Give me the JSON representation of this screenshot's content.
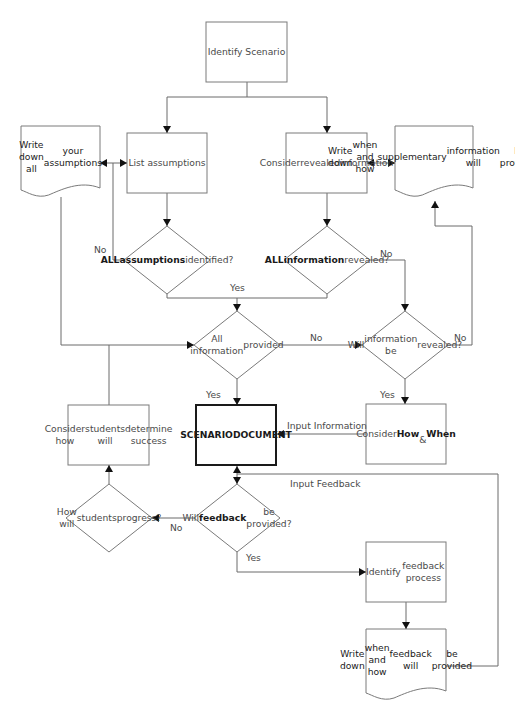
{
  "diagram": {
    "type": "flowchart",
    "nodes": [
      {
        "id": "identify-scenario",
        "shape": "rect",
        "x": 206,
        "y": 22,
        "w": 81,
        "h": 60,
        "lines": [
          "Identify Scenario"
        ]
      },
      {
        "id": "list-assumptions",
        "shape": "rect",
        "x": 127,
        "y": 133,
        "w": 80,
        "h": 60,
        "lines": [
          "List assumptions"
        ]
      },
      {
        "id": "consider-revealed-information",
        "shape": "rect",
        "x": 286,
        "y": 133,
        "w": 81,
        "h": 60,
        "lines": [
          "Consider",
          "revealed",
          "information"
        ]
      },
      {
        "id": "write-down-assumptions",
        "shape": "document",
        "x": 21,
        "y": 126,
        "w": 79,
        "h": 72,
        "lines": [
          "Write down all",
          "your assumptions"
        ]
      },
      {
        "id": "write-down-supplementary",
        "shape": "document",
        "x": 395,
        "y": 126,
        "w": 78,
        "h": 72,
        "lines": [
          "Write down",
          "when and how",
          "supplementary",
          "information will",
          "be provided"
        ]
      },
      {
        "id": "all-assumptions-identified",
        "shape": "diamond",
        "cx": 167,
        "cy": 260,
        "rx": 43,
        "ry": 34,
        "lines": [
          "ALL",
          "assumptions",
          "identified?"
        ],
        "bold_lines": [
          0,
          1
        ]
      },
      {
        "id": "all-information-revealed",
        "shape": "diamond",
        "cx": 327,
        "cy": 260,
        "rx": 43,
        "ry": 34,
        "lines": [
          "ALL",
          "information",
          "revealed?"
        ],
        "bold_lines": [
          0,
          1
        ]
      },
      {
        "id": "all-information-provided",
        "shape": "diamond",
        "cx": 237,
        "cy": 345,
        "rx": 43,
        "ry": 34,
        "lines": [
          "All information",
          "provided"
        ]
      },
      {
        "id": "will-information-be-revealed",
        "shape": "diamond",
        "cx": 405,
        "cy": 345,
        "rx": 43,
        "ry": 34,
        "lines": [
          "Will",
          "information be",
          "revealed?"
        ]
      },
      {
        "id": "scenario-document",
        "shape": "rect-thick",
        "x": 196,
        "y": 405,
        "w": 80,
        "h": 60,
        "lines": [
          "SCENARIO",
          "DOCUMENT"
        ],
        "bold_lines": [
          0,
          1
        ]
      },
      {
        "id": "consider-how-students-determine-success",
        "shape": "rect",
        "x": 68,
        "y": 405,
        "w": 81,
        "h": 60,
        "lines": [
          "Consider how",
          "students will",
          "determine success"
        ]
      },
      {
        "id": "consider-how-when",
        "shape": "rect",
        "x": 366,
        "y": 404,
        "w": 80,
        "h": 60,
        "rich": "Consider <b>How</b><br>&amp; <b>When</b>",
        "lines": [
          "Consider How",
          "& When"
        ]
      },
      {
        "id": "how-will-students-progress",
        "shape": "diamond",
        "cx": 109,
        "cy": 518,
        "rx": 43,
        "ry": 34,
        "lines": [
          "How will",
          "students",
          "progress?"
        ]
      },
      {
        "id": "will-feedback-be-provided",
        "shape": "diamond",
        "cx": 237,
        "cy": 518,
        "rx": 43,
        "ry": 34,
        "rich": "Will<br><b>feedback</b> be<br>provided?",
        "lines": [
          "Will",
          "feedback be",
          "provided?"
        ]
      },
      {
        "id": "identify-feedback-process",
        "shape": "rect",
        "x": 366,
        "y": 542,
        "w": 80,
        "h": 60,
        "lines": [
          "Identify",
          "feedback process"
        ]
      },
      {
        "id": "write-down-feedback",
        "shape": "document",
        "x": 366,
        "y": 629,
        "w": 80,
        "h": 72,
        "lines": [
          "Write down",
          "when and how",
          "feedback will",
          "be provided"
        ]
      }
    ],
    "edges": [
      {
        "from": "identify-scenario",
        "to": "list-assumptions",
        "points": [
          [
            247,
            82
          ],
          [
            247,
            97
          ],
          [
            167,
            97
          ],
          [
            167,
            133
          ]
        ],
        "arrow_end": true
      },
      {
        "from": "identify-scenario",
        "to": "consider-revealed-information",
        "points": [
          [
            247,
            97
          ],
          [
            327,
            97
          ],
          [
            327,
            133
          ]
        ],
        "arrow_end": true
      },
      {
        "from": "list-assumptions",
        "to": "write-down-assumptions",
        "points": [
          [
            127,
            163
          ],
          [
            100,
            163
          ]
        ],
        "arrow_end": true,
        "arrow_start": true
      },
      {
        "from": "consider-revealed-information",
        "to": "write-down-supplementary",
        "points": [
          [
            367,
            163
          ],
          [
            395,
            163
          ]
        ],
        "arrow_end": true,
        "arrow_start": true
      },
      {
        "from": "list-assumptions",
        "to": "all-assumptions-identified",
        "points": [
          [
            167,
            193
          ],
          [
            167,
            226
          ]
        ],
        "arrow_end": true
      },
      {
        "from": "consider-revealed-information",
        "to": "all-information-revealed",
        "points": [
          [
            327,
            193
          ],
          [
            327,
            226
          ]
        ],
        "arrow_end": true
      },
      {
        "from": "all-assumptions-identified",
        "to": "list-assumptions",
        "label": "No",
        "points": [
          [
            124,
            260
          ],
          [
            113,
            260
          ],
          [
            113,
            163
          ]
        ]
      },
      {
        "from": "all-assumptions-identified",
        "to": "all-information-provided",
        "label": "Yes",
        "points": [
          [
            167,
            294
          ],
          [
            167,
            298
          ],
          [
            327,
            298
          ],
          [
            327,
            294
          ]
        ]
      },
      {
        "from": "join-yes",
        "to": "all-information-provided",
        "points": [
          [
            237,
            298
          ],
          [
            237,
            311
          ]
        ],
        "arrow_end": true
      },
      {
        "from": "all-information-revealed",
        "to": "will-information-be-revealed",
        "label": "No",
        "points": [
          [
            370,
            260
          ],
          [
            405,
            260
          ],
          [
            405,
            311
          ]
        ],
        "arrow_end": true
      },
      {
        "from": "write-down-assumptions",
        "to": "all-information-provided",
        "points": [
          [
            61,
            197
          ],
          [
            61,
            345
          ],
          [
            194,
            345
          ]
        ],
        "arrow_end": true
      },
      {
        "from": "consider-how-students-determine-success",
        "to": "all-information-provided",
        "points": [
          [
            109,
            405
          ],
          [
            109,
            345
          ]
        ]
      },
      {
        "from": "all-information-provided",
        "to": "will-information-be-revealed",
        "label": "No",
        "points": [
          [
            280,
            345
          ],
          [
            362,
            345
          ]
        ],
        "arrow_end": true
      },
      {
        "from": "will-information-be-revealed",
        "to": "write-down-supplementary",
        "label": "No",
        "points": [
          [
            448,
            345
          ],
          [
            472,
            345
          ],
          [
            472,
            226
          ],
          [
            435,
            226
          ],
          [
            435,
            201
          ]
        ],
        "arrow_end": true
      },
      {
        "from": "all-information-provided",
        "to": "scenario-document",
        "label": "Yes",
        "points": [
          [
            237,
            379
          ],
          [
            237,
            405
          ]
        ],
        "arrow_end": true
      },
      {
        "from": "will-information-be-revealed",
        "to": "consider-how-when",
        "label": "Yes",
        "points": [
          [
            405,
            379
          ],
          [
            405,
            404
          ]
        ],
        "arrow_end": true
      },
      {
        "from": "consider-how-when",
        "to": "scenario-document",
        "label": "Input Information",
        "points": [
          [
            366,
            434
          ],
          [
            277,
            434
          ]
        ],
        "arrow_end": true
      },
      {
        "from": "scenario-document",
        "to": "will-feedback-be-provided",
        "points": [
          [
            237,
            466
          ],
          [
            237,
            484
          ]
        ],
        "arrow_end": true,
        "arrow_start": true
      },
      {
        "from": "write-down-feedback",
        "to": "scenario-document",
        "label": "Input Feedback",
        "points": [
          [
            446,
            666
          ],
          [
            498,
            666
          ],
          [
            498,
            474
          ],
          [
            237,
            474
          ]
        ]
      },
      {
        "from": "will-feedback-be-provided",
        "to": "how-will-students-progress",
        "label": "No",
        "points": [
          [
            194,
            518
          ],
          [
            152,
            518
          ]
        ],
        "arrow_end": true
      },
      {
        "from": "how-will-students-progress",
        "to": "consider-how-students-determine-success",
        "points": [
          [
            109,
            484
          ],
          [
            109,
            465
          ]
        ],
        "arrow_end": true
      },
      {
        "from": "will-feedback-be-provided",
        "to": "identify-feedback-process",
        "label": "Yes",
        "points": [
          [
            237,
            552
          ],
          [
            237,
            572
          ],
          [
            366,
            572
          ]
        ],
        "arrow_end": true
      },
      {
        "from": "identify-feedback-process",
        "to": "write-down-feedback",
        "points": [
          [
            406,
            602
          ],
          [
            406,
            629
          ]
        ],
        "arrow_end": true
      }
    ],
    "edge_labels": [
      {
        "text": "No",
        "x": 94,
        "y": 244
      },
      {
        "text": "Yes",
        "x": 230,
        "y": 282
      },
      {
        "text": "No",
        "x": 380,
        "y": 248
      },
      {
        "text": "No",
        "x": 310,
        "y": 332
      },
      {
        "text": "No",
        "x": 454,
        "y": 332
      },
      {
        "text": "Yes",
        "x": 206,
        "y": 389
      },
      {
        "text": "Yes",
        "x": 380,
        "y": 389
      },
      {
        "text": "Input Information",
        "x": 287,
        "y": 420
      },
      {
        "text": "Input Feedback",
        "x": 290,
        "y": 478
      },
      {
        "text": "No",
        "x": 170,
        "y": 522
      },
      {
        "text": "Yes",
        "x": 246,
        "y": 552
      }
    ]
  }
}
